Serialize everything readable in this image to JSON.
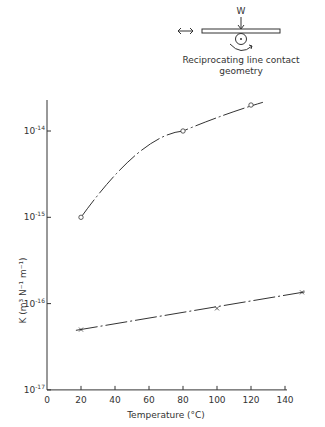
{
  "diagram": {
    "load_label": "W",
    "caption_line1": "Reciprocating line contact",
    "caption_line2": "geometry"
  },
  "chart_data": {
    "type": "line",
    "title": "",
    "xlabel": "Temperature (°C)",
    "ylabel": "K (m³ N⁻¹ m⁻¹)",
    "xscale": "linear",
    "yscale": "log",
    "xlim": [
      0,
      140
    ],
    "ylim": [
      1e-17,
      1e-14
    ],
    "x_ticks": [
      "0",
      "20",
      "40",
      "60",
      "80",
      "100",
      "120",
      "140"
    ],
    "y_ticks": [
      "10^-17",
      "10^-16",
      "10^-15",
      "10^-14"
    ],
    "grid": false,
    "series": [
      {
        "name": "circles",
        "marker": "o",
        "x": [
          20,
          80,
          120
        ],
        "values": [
          1e-15,
          1e-14,
          2e-14
        ]
      },
      {
        "name": "crosses",
        "marker": "x",
        "x": [
          20,
          100,
          150
        ],
        "values": [
          5e-17,
          8.8e-17,
          1.35e-16
        ]
      }
    ]
  },
  "axes": {
    "x_ticks": [
      "0",
      "20",
      "40",
      "60",
      "80",
      "100",
      "120",
      "140"
    ],
    "y_ticks": [
      {
        "base": "10",
        "exp": "-17"
      },
      {
        "base": "10",
        "exp": "-16"
      },
      {
        "base": "10",
        "exp": "-15"
      },
      {
        "base": "10",
        "exp": "-14"
      }
    ],
    "xlabel": "Temperature (°C)",
    "ylabel": "K (m³ N⁻¹ m⁻¹)"
  }
}
